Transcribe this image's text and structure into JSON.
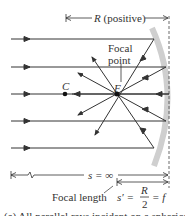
{
  "diagram": {
    "title_partial": "(a) All parallel rays incident on a spherical",
    "labels": {
      "radius": "R",
      "radius_note": "(positive)",
      "focal_point_line1": "Focal",
      "focal_point_line2": "point",
      "focus": "F",
      "center": "C",
      "object_distance": "s = ∞",
      "focal_length": "Focal length",
      "image_distance_lhs": "s′ =",
      "fraction_num": "R",
      "fraction_den": "2",
      "image_distance_rhs": "= f"
    },
    "colors": {
      "ray": "#333333",
      "mirror": "#c8c8c8",
      "dashed_axis": "#444444",
      "text": "#333333"
    },
    "rays_count": 5,
    "mirror_type": "concave"
  }
}
